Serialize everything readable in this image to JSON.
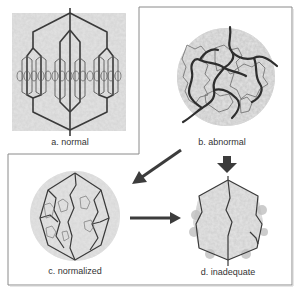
{
  "panels": {
    "a": {
      "label": "a. normal"
    },
    "b": {
      "label": "b. abnormal"
    },
    "c": {
      "label": "c. normalized"
    },
    "d": {
      "label": "d. inadequate"
    }
  },
  "arrows": [
    {
      "from": "b",
      "to": "c",
      "direction": "down-left"
    },
    {
      "from": "c",
      "to": "d",
      "direction": "right"
    },
    {
      "from": "b",
      "to": "d",
      "direction": "down"
    }
  ],
  "colors": {
    "vessel": "#3a3a3a",
    "tissue": "#c8c8c8",
    "border": "#8a8a8a",
    "arrow": "#3c3c3c"
  }
}
